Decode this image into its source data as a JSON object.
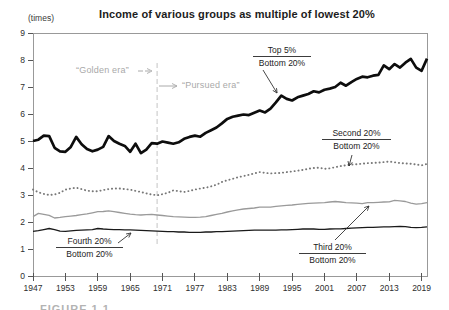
{
  "y_axis_unit_label": "(times)",
  "era_annotations": {
    "golden": "“Golden era”",
    "pursued": "“Pursued era”"
  },
  "fraction_labels": {
    "top5": {
      "num": "Top 5%",
      "den": "Bottom 20%"
    },
    "second": {
      "num": "Second 20%",
      "den": "Bottom 20%"
    },
    "third": {
      "num": "Third 20%",
      "den": "Bottom 20%"
    },
    "fourth": {
      "num": "Fourth 20%",
      "den": "Bottom 20%"
    }
  },
  "caption_sliver": "FIGURE 1.1",
  "colors": {
    "title_text": "#1c1c1c",
    "era_text": "#a9a9a9",
    "era_divider": "#c4c4c4",
    "axis_box": "#999999",
    "axis_ticks": "#555555",
    "arrow_black": "#333333",
    "arrow_gray": "#aaaaaa"
  },
  "chart_data": {
    "type": "line",
    "title": "Income of various groups as multiple of lowest 20%",
    "xlabel": "",
    "ylabel": "(times)",
    "xlim": [
      1947,
      2020
    ],
    "ylim": [
      0,
      9
    ],
    "grid": false,
    "legend": "inline-annotations",
    "era_divider_year": 1970,
    "x_years": {
      "start": 1947,
      "end": 2020,
      "step": 1
    },
    "x_ticks": [
      1947,
      1953,
      1959,
      1965,
      1971,
      1977,
      1983,
      1989,
      1995,
      2001,
      2007,
      2013,
      2019
    ],
    "y_ticks": [
      0,
      1,
      2,
      3,
      4,
      5,
      6,
      7,
      8,
      9
    ],
    "series": [
      {
        "name": "Top 5% / Bottom 20%",
        "style": "thick-black",
        "color": "#0d0d0d",
        "values": [
          5.0,
          5.05,
          5.2,
          5.18,
          4.75,
          4.62,
          4.6,
          4.78,
          5.15,
          4.88,
          4.7,
          4.62,
          4.68,
          4.78,
          5.18,
          5.0,
          4.9,
          4.82,
          4.6,
          4.9,
          4.55,
          4.68,
          4.92,
          4.9,
          4.98,
          4.94,
          4.9,
          4.95,
          5.08,
          5.15,
          5.2,
          5.16,
          5.3,
          5.4,
          5.5,
          5.65,
          5.82,
          5.9,
          5.94,
          5.98,
          5.96,
          6.05,
          6.13,
          6.06,
          6.2,
          6.43,
          6.68,
          6.56,
          6.5,
          6.62,
          6.68,
          6.74,
          6.84,
          6.8,
          6.9,
          6.94,
          7.0,
          7.16,
          7.05,
          7.18,
          7.3,
          7.38,
          7.36,
          7.42,
          7.45,
          7.8,
          7.66,
          7.85,
          7.72,
          7.9,
          8.04,
          7.72,
          7.6,
          8.05
        ]
      },
      {
        "name": "Second 20% / Bottom 20%",
        "style": "dotted-gray",
        "color": "#787878",
        "values": [
          3.2,
          3.1,
          3.04,
          3.0,
          3.02,
          3.08,
          3.2,
          3.24,
          3.27,
          3.22,
          3.16,
          3.14,
          3.14,
          3.18,
          3.22,
          3.24,
          3.24,
          3.22,
          3.2,
          3.15,
          3.11,
          3.06,
          3.02,
          2.99,
          3.03,
          3.08,
          3.17,
          3.14,
          3.11,
          3.15,
          3.2,
          3.24,
          3.27,
          3.32,
          3.38,
          3.48,
          3.55,
          3.6,
          3.66,
          3.7,
          3.75,
          3.8,
          3.85,
          3.82,
          3.8,
          3.81,
          3.82,
          3.85,
          3.87,
          3.9,
          3.93,
          3.97,
          4.0,
          4.01,
          3.97,
          3.99,
          4.03,
          4.07,
          4.1,
          4.13,
          4.14,
          4.16,
          4.18,
          4.19,
          4.2,
          4.22,
          4.24,
          4.21,
          4.18,
          4.17,
          4.16,
          4.13,
          4.1,
          4.15
        ]
      },
      {
        "name": "Third 20% / Bottom 20%",
        "style": "solid-gray",
        "color": "#9a9a9a",
        "values": [
          2.2,
          2.32,
          2.28,
          2.25,
          2.15,
          2.17,
          2.2,
          2.22,
          2.24,
          2.27,
          2.3,
          2.34,
          2.38,
          2.39,
          2.41,
          2.38,
          2.35,
          2.32,
          2.29,
          2.27,
          2.26,
          2.27,
          2.28,
          2.26,
          2.24,
          2.22,
          2.2,
          2.19,
          2.18,
          2.17,
          2.17,
          2.18,
          2.2,
          2.24,
          2.28,
          2.32,
          2.37,
          2.41,
          2.45,
          2.48,
          2.5,
          2.52,
          2.55,
          2.55,
          2.55,
          2.58,
          2.6,
          2.62,
          2.63,
          2.65,
          2.67,
          2.69,
          2.7,
          2.71,
          2.72,
          2.74,
          2.76,
          2.74,
          2.72,
          2.71,
          2.7,
          2.68,
          2.72,
          2.72,
          2.73,
          2.74,
          2.75,
          2.8,
          2.78,
          2.76,
          2.7,
          2.66,
          2.68,
          2.72
        ]
      },
      {
        "name": "Fourth 20% / Bottom 20%",
        "style": "thin-black",
        "color": "#1a1a1a",
        "values": [
          1.65,
          1.68,
          1.72,
          1.76,
          1.72,
          1.66,
          1.65,
          1.67,
          1.69,
          1.7,
          1.71,
          1.72,
          1.76,
          1.74,
          1.73,
          1.72,
          1.72,
          1.71,
          1.71,
          1.7,
          1.69,
          1.68,
          1.67,
          1.66,
          1.65,
          1.64,
          1.64,
          1.63,
          1.63,
          1.62,
          1.62,
          1.62,
          1.63,
          1.63,
          1.64,
          1.64,
          1.65,
          1.66,
          1.67,
          1.68,
          1.69,
          1.7,
          1.7,
          1.7,
          1.7,
          1.7,
          1.71,
          1.71,
          1.72,
          1.73,
          1.74,
          1.74,
          1.74,
          1.73,
          1.73,
          1.74,
          1.75,
          1.75,
          1.76,
          1.77,
          1.78,
          1.79,
          1.8,
          1.8,
          1.81,
          1.82,
          1.82,
          1.83,
          1.84,
          1.83,
          1.8,
          1.79,
          1.8,
          1.82
        ]
      }
    ]
  }
}
